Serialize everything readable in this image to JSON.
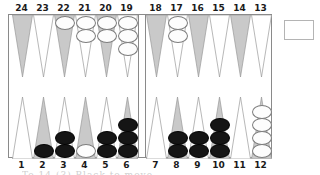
{
  "board": {
    "title": "Backgammon board position",
    "top_point_numbers": [
      "24",
      "23",
      "22",
      "21",
      "20",
      "19",
      "18",
      "17",
      "16",
      "15",
      "14",
      "13"
    ],
    "bottom_point_numbers": [
      "1",
      "2",
      "3",
      "4",
      "5",
      "6",
      "7",
      "8",
      "9",
      "10",
      "11",
      "12"
    ],
    "colors": {
      "point_shaded": "#c9c9c9",
      "point_plain": "#ffffff",
      "point_outline": "#9a9a9a",
      "frame_outline": "#8a8a8a",
      "checker_white": "#fdfdfd",
      "checker_black": "#151515",
      "background": "#ffffff",
      "label_text": "#1a1a1a"
    },
    "tray_label": "",
    "caption": "To 14 (3) Black to move"
  },
  "chart_data": {
    "type": "table",
    "categories": [
      "1",
      "2",
      "3",
      "4",
      "5",
      "6",
      "7",
      "8",
      "9",
      "10",
      "11",
      "12",
      "13",
      "14",
      "15",
      "16",
      "17",
      "18",
      "19",
      "20",
      "21",
      "22",
      "23",
      "24"
    ],
    "series": [
      {
        "name": "white",
        "values": [
          0,
          0,
          0,
          1,
          0,
          0,
          0,
          0,
          0,
          0,
          0,
          4,
          0,
          0,
          0,
          0,
          2,
          0,
          3,
          2,
          2,
          1,
          0,
          0
        ]
      },
      {
        "name": "black",
        "values": [
          0,
          1,
          2,
          0,
          2,
          3,
          0,
          2,
          2,
          3,
          0,
          0,
          0,
          0,
          0,
          0,
          0,
          0,
          0,
          0,
          0,
          0,
          0,
          0
        ]
      }
    ],
    "xlabel": "Point number",
    "ylabel": "Checkers on point"
  },
  "points": [
    {
      "num": "13",
      "row": "top",
      "slot": 11,
      "shaded": false,
      "white": 0,
      "black": 0
    },
    {
      "num": "14",
      "row": "top",
      "slot": 10,
      "shaded": true,
      "white": 0,
      "black": 0
    },
    {
      "num": "15",
      "row": "top",
      "slot": 9,
      "shaded": false,
      "white": 0,
      "black": 0
    },
    {
      "num": "16",
      "row": "top",
      "slot": 8,
      "shaded": true,
      "white": 0,
      "black": 0
    },
    {
      "num": "17",
      "row": "top",
      "slot": 7,
      "shaded": false,
      "white": 2,
      "black": 0
    },
    {
      "num": "18",
      "row": "top",
      "slot": 6,
      "shaded": true,
      "white": 0,
      "black": 0
    },
    {
      "num": "19",
      "row": "top",
      "slot": 5,
      "shaded": false,
      "white": 3,
      "black": 0
    },
    {
      "num": "20",
      "row": "top",
      "slot": 4,
      "shaded": true,
      "white": 2,
      "black": 0
    },
    {
      "num": "21",
      "row": "top",
      "slot": 3,
      "shaded": false,
      "white": 2,
      "black": 0
    },
    {
      "num": "22",
      "row": "top",
      "slot": 2,
      "shaded": true,
      "white": 1,
      "black": 0
    },
    {
      "num": "23",
      "row": "top",
      "slot": 1,
      "shaded": false,
      "white": 0,
      "black": 0
    },
    {
      "num": "24",
      "row": "top",
      "slot": 0,
      "shaded": true,
      "white": 0,
      "black": 0
    },
    {
      "num": "1",
      "row": "bottom",
      "slot": 0,
      "shaded": false,
      "white": 0,
      "black": 0
    },
    {
      "num": "2",
      "row": "bottom",
      "slot": 1,
      "shaded": true,
      "white": 0,
      "black": 1
    },
    {
      "num": "3",
      "row": "bottom",
      "slot": 2,
      "shaded": false,
      "white": 0,
      "black": 2
    },
    {
      "num": "4",
      "row": "bottom",
      "slot": 3,
      "shaded": true,
      "white": 1,
      "black": 0
    },
    {
      "num": "5",
      "row": "bottom",
      "slot": 4,
      "shaded": false,
      "white": 0,
      "black": 2
    },
    {
      "num": "6",
      "row": "bottom",
      "slot": 5,
      "shaded": true,
      "white": 0,
      "black": 3
    },
    {
      "num": "7",
      "row": "bottom",
      "slot": 6,
      "shaded": false,
      "white": 0,
      "black": 0
    },
    {
      "num": "8",
      "row": "bottom",
      "slot": 7,
      "shaded": true,
      "white": 0,
      "black": 2
    },
    {
      "num": "9",
      "row": "bottom",
      "slot": 8,
      "shaded": false,
      "white": 0,
      "black": 2
    },
    {
      "num": "10",
      "row": "bottom",
      "slot": 9,
      "shaded": true,
      "white": 0,
      "black": 3
    },
    {
      "num": "11",
      "row": "bottom",
      "slot": 10,
      "shaded": false,
      "white": 0,
      "black": 0
    },
    {
      "num": "12",
      "row": "bottom",
      "slot": 11,
      "shaded": true,
      "white": 4,
      "black": 0
    }
  ]
}
